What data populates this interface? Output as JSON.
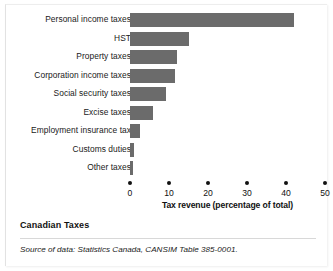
{
  "chart_data": {
    "type": "bar",
    "orientation": "horizontal",
    "categories": [
      "Personal income taxes",
      "HST",
      "Property taxes",
      "Corporation income taxes",
      "Social security taxes",
      "Excise taxes",
      "Employment insurance tax",
      "Customs duties",
      "Other taxes"
    ],
    "values": [
      42,
      15,
      12,
      11.5,
      9.3,
      6,
      2.5,
      1,
      0.8
    ],
    "title": "",
    "xlabel": "Tax revenue (percentage of total)",
    "ylabel": "",
    "xlim": [
      0,
      50
    ],
    "xticks": [
      0,
      10,
      20,
      30,
      40,
      50
    ],
    "xtick_labels": [
      "0",
      "10",
      "20",
      "30",
      "40",
      "50"
    ],
    "grid": false,
    "legend": false,
    "bar_color": "#6b6b6b"
  },
  "caption": {
    "title": "Canadian Taxes",
    "source": "Source of data: Statistics Canada, CANSIM Table 385-0001."
  }
}
